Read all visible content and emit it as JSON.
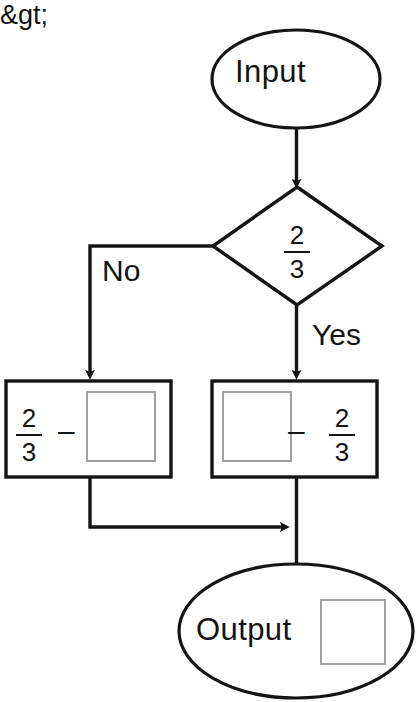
{
  "diagram": {
    "type": "flowchart",
    "background_color": "#fefefe",
    "stroke_color": "#141414",
    "placeholder_color": "#a0a0a0"
  },
  "nodes": {
    "start": {
      "shape": "ellipse",
      "label": "Input"
    },
    "decision": {
      "shape": "diamond",
      "operator": "&gt;",
      "fraction": {
        "numerator": "2",
        "denominator": "3"
      },
      "condition_text": "> 2/3"
    },
    "process_no": {
      "shape": "rectangle",
      "fraction": {
        "numerator": "2",
        "denominator": "3"
      },
      "operator": "–",
      "answer_placeholder": "",
      "expression_text": "2/3 – □"
    },
    "process_yes": {
      "shape": "rectangle",
      "answer_placeholder": "",
      "operator": "–",
      "fraction": {
        "numerator": "2",
        "denominator": "3"
      },
      "expression_text": "□ – 2/3"
    },
    "end": {
      "shape": "ellipse",
      "label": "Output",
      "answer_placeholder": ""
    }
  },
  "edges": {
    "start_to_decision": {
      "label": ""
    },
    "decision_to_no": {
      "label": "No"
    },
    "decision_to_yes": {
      "label": "Yes"
    },
    "no_to_merge": {
      "label": ""
    },
    "yes_to_end": {
      "label": ""
    }
  }
}
